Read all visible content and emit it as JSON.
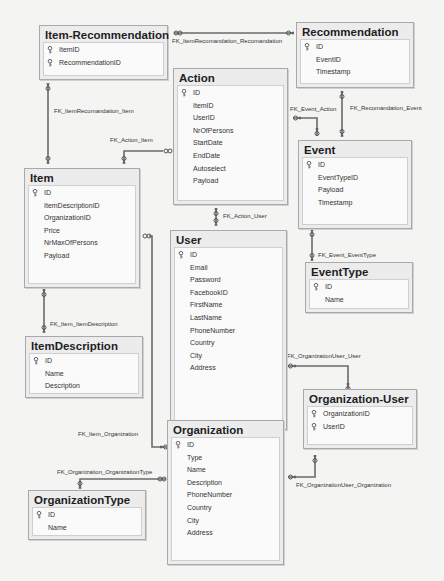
{
  "diagram": {
    "tables": {
      "item_recommendation": {
        "name": "Item-Recommendation",
        "columns": [
          {
            "name": "ItemID",
            "pk": true
          },
          {
            "name": "RecommendationID",
            "pk": true
          }
        ]
      },
      "recommendation": {
        "name": "Recommendation",
        "columns": [
          {
            "name": "ID",
            "pk": true
          },
          {
            "name": "EventID",
            "pk": false
          },
          {
            "name": "Timestamp",
            "pk": false
          }
        ]
      },
      "action": {
        "name": "Action",
        "columns": [
          {
            "name": "ID",
            "pk": true
          },
          {
            "name": "ItemID",
            "pk": false
          },
          {
            "name": "UserID",
            "pk": false
          },
          {
            "name": "NrOfPersons",
            "pk": false
          },
          {
            "name": "StartDate",
            "pk": false
          },
          {
            "name": "EndDate",
            "pk": false
          },
          {
            "name": "Autoselect",
            "pk": false
          },
          {
            "name": "Payload",
            "pk": false
          }
        ]
      },
      "event": {
        "name": "Event",
        "columns": [
          {
            "name": "ID",
            "pk": true
          },
          {
            "name": "EventTypeID",
            "pk": false
          },
          {
            "name": "Payload",
            "pk": false
          },
          {
            "name": "Timestamp",
            "pk": false
          }
        ]
      },
      "item": {
        "name": "Item",
        "columns": [
          {
            "name": "ID",
            "pk": true
          },
          {
            "name": "ItemDescriptionID",
            "pk": false
          },
          {
            "name": "OrganizationID",
            "pk": false
          },
          {
            "name": "Price",
            "pk": false
          },
          {
            "name": "NrMaxOfPersons",
            "pk": false
          },
          {
            "name": "Payload",
            "pk": false
          }
        ]
      },
      "user": {
        "name": "User",
        "columns": [
          {
            "name": "ID",
            "pk": true
          },
          {
            "name": "Email",
            "pk": false
          },
          {
            "name": "Password",
            "pk": false
          },
          {
            "name": "FacebookID",
            "pk": false
          },
          {
            "name": "FirstName",
            "pk": false
          },
          {
            "name": "LastName",
            "pk": false
          },
          {
            "name": "PhoneNumber",
            "pk": false
          },
          {
            "name": "Country",
            "pk": false
          },
          {
            "name": "City",
            "pk": false
          },
          {
            "name": "Address",
            "pk": false
          }
        ]
      },
      "event_type": {
        "name": "EventType",
        "columns": [
          {
            "name": "ID",
            "pk": true
          },
          {
            "name": "Name",
            "pk": false
          }
        ]
      },
      "item_description": {
        "name": "ItemDescription",
        "columns": [
          {
            "name": "ID",
            "pk": true
          },
          {
            "name": "Name",
            "pk": false
          },
          {
            "name": "Description",
            "pk": false
          }
        ]
      },
      "organization_user": {
        "name": "Organization-User",
        "columns": [
          {
            "name": "OrganizationID",
            "pk": true
          },
          {
            "name": "UserID",
            "pk": true
          }
        ]
      },
      "organization": {
        "name": "Organization",
        "columns": [
          {
            "name": "ID",
            "pk": true
          },
          {
            "name": "Type",
            "pk": false
          },
          {
            "name": "Name",
            "pk": false
          },
          {
            "name": "Description",
            "pk": false
          },
          {
            "name": "PhoneNumber",
            "pk": false
          },
          {
            "name": "Country",
            "pk": false
          },
          {
            "name": "City",
            "pk": false
          },
          {
            "name": "Address",
            "pk": false
          }
        ]
      },
      "organization_type": {
        "name": "OrganizationType",
        "columns": [
          {
            "name": "ID",
            "pk": true
          },
          {
            "name": "Name",
            "pk": false
          }
        ]
      }
    },
    "relationships": {
      "fk_itemrec_rec": "FK_ItemRecomandation_Recomandation",
      "fk_itemrec_item": "FK_ItemRecomandation_Item",
      "fk_action_item": "FK_Action_Item",
      "fk_event_action": "FK_Event_Action",
      "fk_rec_event": "FK_Recomandation_Event",
      "fk_action_user": "FK_Action_User",
      "fk_event_eventtype": "FK_Event_EventType",
      "fk_item_itemdesc": "FK_Item_ItemDescription",
      "fk_orguser_user": "FK_OrganizationUser_User",
      "fk_item_org": "FK_Item_Organization",
      "fk_org_orgtype": "FK_Organization_OrganizationType",
      "fk_orguser_org": "FK_OrganizationUser_Organization"
    }
  }
}
